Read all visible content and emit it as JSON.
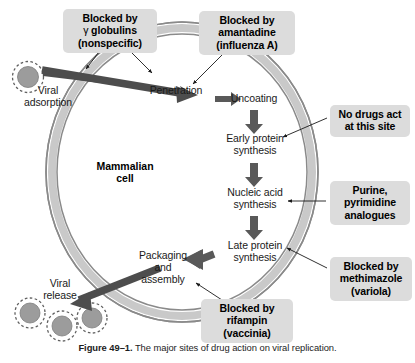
{
  "figure": {
    "caption_label": "Figure 49–1.",
    "caption_text": "The major sites of drug action on viral replication.",
    "cell_label_line1": "Mammalian",
    "cell_label_line2": "cell"
  },
  "colors": {
    "background": "#ffffff",
    "callout_fill": "#dcdcdc",
    "membrane_band": "#c8c8c8",
    "membrane_edge": "#8c8c8c",
    "block_arrow": "#585858",
    "thick_arrow": "#4a4a4a",
    "virion_fill": "#9a9a9a",
    "virion_ring": "#6e6e6e",
    "text": "#000000"
  },
  "stages": [
    {
      "name": "viral-adsorption",
      "lines": [
        "Viral",
        "adsorption"
      ]
    },
    {
      "name": "penetration",
      "lines": [
        "Penetration"
      ]
    },
    {
      "name": "uncoating",
      "lines": [
        "Uncoating"
      ]
    },
    {
      "name": "early-protein-synthesis",
      "lines": [
        "Early protein",
        "synthesis"
      ]
    },
    {
      "name": "nucleic-acid-synthesis",
      "lines": [
        "Nucleic acid",
        "synthesis"
      ]
    },
    {
      "name": "late-protein-synthesis",
      "lines": [
        "Late protein",
        "synthesis"
      ]
    },
    {
      "name": "packaging-and-assembly",
      "lines": [
        "Packaging",
        "and",
        "assembly"
      ]
    },
    {
      "name": "viral-release",
      "lines": [
        "Viral",
        "release"
      ]
    }
  ],
  "callouts": [
    {
      "name": "gamma-globulins",
      "bold": true,
      "lines": [
        "Blocked by",
        "γ globulins",
        "(nonspecific)"
      ],
      "target": "viral adsorption / penetration"
    },
    {
      "name": "amantadine",
      "bold": true,
      "lines": [
        "Blocked by",
        "amantadine",
        "(influenza A)"
      ],
      "target": "penetration"
    },
    {
      "name": "no-drugs-act",
      "bold": false,
      "lines": [
        "No drugs act",
        "at this site"
      ],
      "target": "early protein synthesis"
    },
    {
      "name": "purine-pyrimidine-analogues",
      "bold": false,
      "lines": [
        "Purine,",
        "pyrimidine",
        "analogues"
      ],
      "target": "nucleic acid synthesis"
    },
    {
      "name": "methimazole",
      "bold": true,
      "lines": [
        "Blocked by",
        "methimazole",
        "(variola)"
      ],
      "target": "late protein synthesis"
    },
    {
      "name": "rifampin",
      "bold": true,
      "lines": [
        "Blocked by",
        "rifampin",
        "(vaccinia)"
      ],
      "target": "packaging and assembly"
    }
  ],
  "virions": {
    "adsorbing_count": 1,
    "released_count": 3
  },
  "labels": {
    "stage_viral_line1": "Viral",
    "stage_viral_line2": "adsorption",
    "stage_penetration": "Penetration",
    "stage_uncoating": "Uncoating",
    "stage_early_line1": "Early protein",
    "stage_early_line2": "synthesis",
    "stage_nucleic_line1": "Nucleic acid",
    "stage_nucleic_line2": "synthesis",
    "stage_late_line1": "Late protein",
    "stage_late_line2": "synthesis",
    "stage_pack_line1": "Packaging",
    "stage_pack_line2": "and",
    "stage_pack_line3": "assembly",
    "stage_release_line1": "Viral",
    "stage_release_line2": "release",
    "c1_l1": "Blocked by",
    "c1_l2a": "γ",
    "c1_l2b": "globulins",
    "c1_l3": "(nonspecific)",
    "c2_l1": "Blocked by",
    "c2_l2": "amantadine",
    "c2_l3": "(influenza A)",
    "c3_l1": "No drugs act",
    "c3_l2": "at this site",
    "c4_l1": "Purine,",
    "c4_l2": "pyrimidine",
    "c4_l3": "analogues",
    "c5_l1": "Blocked by",
    "c5_l2": "methimazole",
    "c5_l3": "(variola)",
    "c6_l1": "Blocked by",
    "c6_l2": "rifampin",
    "c6_l3": "(vaccinia)"
  }
}
